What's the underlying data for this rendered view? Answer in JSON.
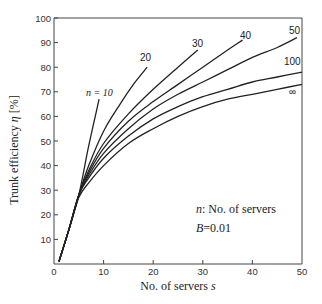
{
  "chart_data": {
    "type": "line",
    "title": "",
    "xlabel": "No. of servers s",
    "ylabel": "Trunk efficiency η [%]",
    "xlim": [
      0,
      50
    ],
    "ylim": [
      0,
      100
    ],
    "x_ticks": [
      0,
      10,
      20,
      30,
      40,
      50
    ],
    "y_ticks": [
      10,
      20,
      30,
      40,
      50,
      60,
      70,
      80,
      90,
      100
    ],
    "grid": false,
    "legend": "inline curve labels",
    "annotations": [
      "n: No. of servers",
      "B=0.01"
    ],
    "series": [
      {
        "name": "n = 10",
        "label": "n = 10",
        "x": [
          1,
          3,
          5,
          7,
          9.1
        ],
        "y": [
          1,
          14,
          28,
          48,
          67
        ]
      },
      {
        "name": "20",
        "label": "20",
        "x": [
          1,
          3,
          5,
          7,
          10,
          13,
          16,
          18.8
        ],
        "y": [
          1,
          14,
          28,
          40,
          54,
          64,
          73,
          80
        ]
      },
      {
        "name": "30",
        "label": "30",
        "x": [
          1,
          3,
          5,
          7,
          10,
          15,
          20,
          25,
          29
        ],
        "y": [
          1,
          14,
          28,
          38,
          49,
          61,
          71,
          80,
          87
        ]
      },
      {
        "name": "40",
        "label": "40",
        "x": [
          1,
          3,
          5,
          7,
          10,
          15,
          20,
          25,
          30,
          35,
          38
        ],
        "y": [
          1,
          14,
          28,
          37,
          47,
          58,
          66,
          73,
          80,
          87,
          91
        ]
      },
      {
        "name": "50",
        "label": "50",
        "x": [
          1,
          3,
          5,
          7,
          10,
          15,
          20,
          25,
          30,
          35,
          40,
          45,
          49
        ],
        "y": [
          1,
          14,
          28,
          36,
          45,
          55,
          63,
          69,
          74,
          79,
          84,
          88,
          92
        ]
      },
      {
        "name": "100",
        "label": "100",
        "x": [
          1,
          3,
          5,
          7,
          10,
          15,
          20,
          25,
          30,
          35,
          40,
          45,
          50
        ],
        "y": [
          1,
          14,
          28,
          35,
          43,
          52,
          59,
          64,
          68,
          71,
          74,
          76,
          78
        ]
      },
      {
        "name": "∞",
        "label": "∞",
        "x": [
          1,
          3,
          5,
          7,
          10,
          15,
          20,
          25,
          30,
          35,
          40,
          45,
          50
        ],
        "y": [
          1,
          14,
          27,
          33,
          40,
          49,
          55,
          60,
          64,
          67,
          69,
          71,
          73
        ]
      }
    ]
  },
  "axes": {
    "x_title": "No. of servers",
    "x_title_var": "s",
    "y_title": "Trunk efficiency",
    "y_title_var": "η",
    "y_title_unit": "[%]",
    "x_tick_labels": [
      "0",
      "10",
      "20",
      "30",
      "40",
      "50"
    ],
    "y_tick_labels": [
      "10",
      "20",
      "30",
      "40",
      "50",
      "60",
      "70",
      "80",
      "90",
      "100"
    ]
  },
  "labels": {
    "n10": "n = 10",
    "n20": "20",
    "n30": "30",
    "n40": "40",
    "n50": "50",
    "n100": "100",
    "ninf": "∞"
  },
  "notes": {
    "line1_var": "n",
    "line1_text": ": No. of servers",
    "line2_var": "B",
    "line2_text": "=0.01"
  }
}
